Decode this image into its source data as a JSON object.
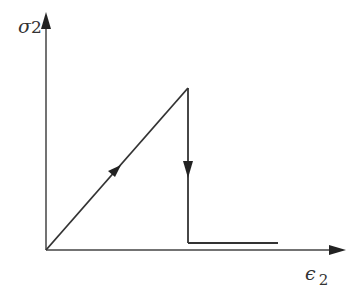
{
  "diagram": {
    "type": "stress-strain curve",
    "y_axis": {
      "label": "σ",
      "subscript": "2"
    },
    "x_axis": {
      "label": "ϵ",
      "subscript": "2"
    },
    "colors": {
      "line": "#333333",
      "background": "#ffffff"
    },
    "path": [
      {
        "point": "origin",
        "x": 46,
        "y": 250
      },
      {
        "point": "peak",
        "x": 188,
        "y": 88
      },
      {
        "point": "drop",
        "x": 188,
        "y": 243
      },
      {
        "point": "residual-end",
        "x": 278,
        "y": 243
      }
    ],
    "arrows": [
      {
        "segment": "loading",
        "direction": "up-right"
      },
      {
        "segment": "softening-drop",
        "direction": "down"
      }
    ]
  }
}
